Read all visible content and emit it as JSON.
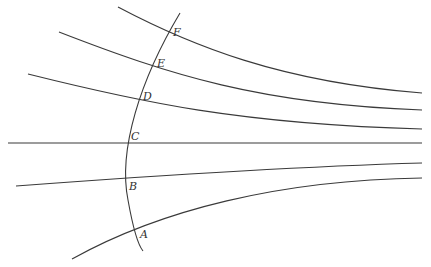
{
  "diagram": {
    "labels": {
      "A": "A",
      "B": "B",
      "C": "C",
      "D": "D",
      "E": "E",
      "F": "F"
    },
    "colors": {
      "stroke": "#3a3a3a",
      "background": "#ffffff"
    }
  }
}
